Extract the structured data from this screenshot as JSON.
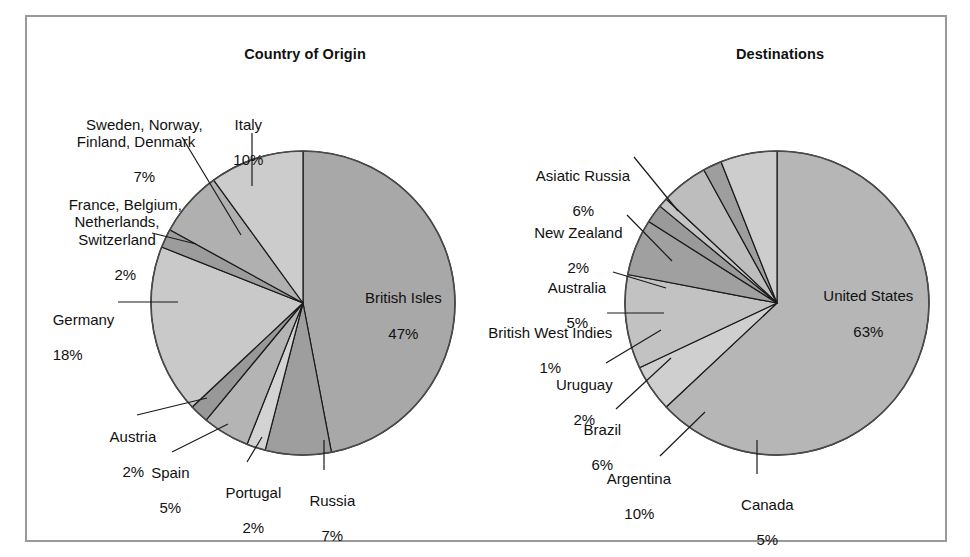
{
  "frame": {
    "border_color": "#9a9a9a",
    "background": "#ffffff"
  },
  "charts": [
    {
      "id": "origin",
      "title": "Country of Origin"
    },
    {
      "id": "destinations",
      "title": "Destinations"
    }
  ],
  "labels": {
    "origin": {
      "sweden": {
        "name": "Sweden, Norway,\nFinland, Denmark",
        "pct": "7%"
      },
      "italy": {
        "name": "Italy",
        "pct": "10%"
      },
      "france": {
        "name": "France, Belgium,\nNetherlands,\nSwitzerland",
        "pct": "2%"
      },
      "germany": {
        "name": "Germany",
        "pct": "18%"
      },
      "austria": {
        "name": "Austria",
        "pct": "2%"
      },
      "spain": {
        "name": "Spain",
        "pct": "5%"
      },
      "portugal": {
        "name": "Portugal",
        "pct": "2%"
      },
      "russia": {
        "name": "Russia",
        "pct": "7%"
      },
      "british_isles": {
        "name": "British Isles",
        "pct": "47%"
      }
    },
    "destinations": {
      "asiatic_russia": {
        "name": "Asiatic Russia",
        "pct": "6%"
      },
      "new_zealand": {
        "name": "New Zealand",
        "pct": "2%"
      },
      "australia": {
        "name": "Australia",
        "pct": "5%"
      },
      "bwi": {
        "name": "British West Indies",
        "pct": "1%"
      },
      "uruguay": {
        "name": "Uruguay",
        "pct": "2%"
      },
      "brazil": {
        "name": "Brazil",
        "pct": "6%"
      },
      "argentina": {
        "name": "Argentina",
        "pct": "10%"
      },
      "canada": {
        "name": "Canada",
        "pct": "5%"
      },
      "united_states": {
        "name": "United States",
        "pct": "63%"
      }
    }
  },
  "chart_data": [
    {
      "type": "pie",
      "id": "origin",
      "title": "Country of Origin",
      "unit": "percent",
      "total": 100,
      "start_angle_deg": 0,
      "direction": "clockwise",
      "center": [
        303,
        303
      ],
      "radius": 152,
      "categories": [
        "British Isles",
        "Russia",
        "Portugal",
        "Spain",
        "Austria",
        "Germany",
        "France, Belgium, Netherlands, Switzerland",
        "Sweden, Norway, Finland, Denmark",
        "Italy"
      ],
      "values": [
        47,
        7,
        2,
        5,
        2,
        18,
        2,
        7,
        10
      ],
      "labels": [
        "47%",
        "7%",
        "2%",
        "5%",
        "2%",
        "18%",
        "2%",
        "7%",
        "10%"
      ],
      "colors": [
        "#a8a8a8",
        "#9e9e9e",
        "#d3d3d3",
        "#b4b4b4",
        "#989898",
        "#c9c9c9",
        "#9c9c9c",
        "#b0b0b0",
        "#cccccc"
      ],
      "legend": "none",
      "grid": false
    },
    {
      "type": "pie",
      "id": "destinations",
      "title": "Destinations",
      "unit": "percent",
      "total": 100,
      "start_angle_deg": 0,
      "direction": "clockwise",
      "center": [
        777,
        303
      ],
      "radius": 152,
      "categories": [
        "United States",
        "Canada",
        "Argentina",
        "Brazil",
        "Uruguay",
        "British West Indies",
        "Australia",
        "New Zealand",
        "Asiatic Russia"
      ],
      "values": [
        63,
        5,
        10,
        6,
        2,
        1,
        5,
        2,
        6
      ],
      "labels": [
        "63%",
        "5%",
        "10%",
        "6%",
        "2%",
        "1%",
        "5%",
        "2%",
        "6%"
      ],
      "colors": [
        "#b6b6b6",
        "#cfcfcf",
        "#c2c2c2",
        "#a0a0a0",
        "#9a9a9a",
        "#c4c4c4",
        "#bdbdbd",
        "#9e9e9e",
        "#cdcdcd"
      ],
      "legend": "none",
      "grid": false
    }
  ]
}
